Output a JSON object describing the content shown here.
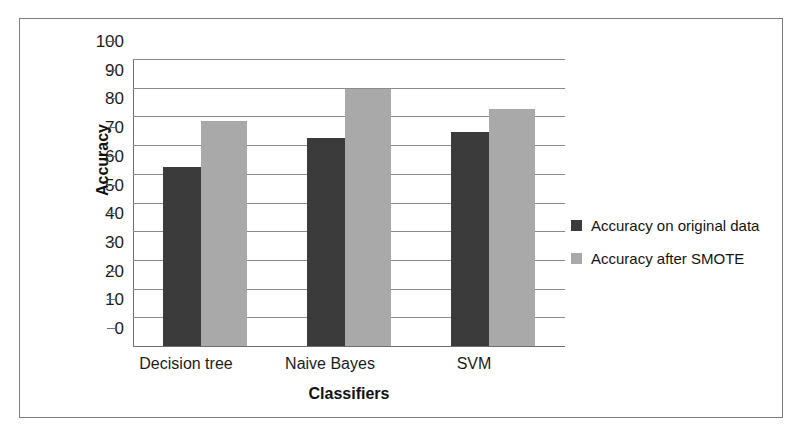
{
  "chart_data": {
    "type": "bar",
    "title": "",
    "xlabel": "Classifiers",
    "ylabel": "Accuracy",
    "categories": [
      "Decision tree",
      "Naive Bayes",
      "SVM"
    ],
    "series": [
      {
        "name": "Accuracy on original data",
        "color": "#3b3b3b",
        "values": [
          62.5,
          72.5,
          74.5
        ]
      },
      {
        "name": "Accuracy after SMOTE",
        "color": "#a9a9a9",
        "values": [
          78.5,
          89.5,
          82.5
        ]
      }
    ],
    "ylim": [
      0,
      100
    ],
    "ytick_step": 10,
    "yticks": [
      100,
      90,
      80,
      70,
      60,
      50,
      40,
      30,
      20,
      10,
      0
    ],
    "grid": true,
    "grid_axis": "y",
    "legend_position": "right"
  },
  "frame": {
    "border_color": "#7d7d7d",
    "background": "#ffffff"
  }
}
